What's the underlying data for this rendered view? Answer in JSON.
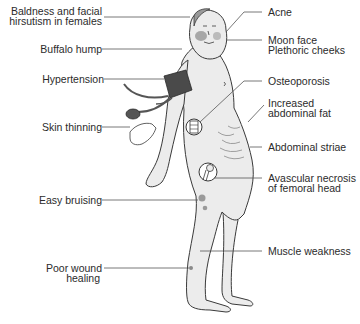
{
  "diagram": {
    "colors": {
      "skin": "#ececec",
      "outline": "#3a3a3a",
      "leader_line": "#555555",
      "cuff": "#4a4a4a",
      "cheek": "#8a8a8a",
      "bruise": "#9a9a9a",
      "text": "#2b2b2b"
    }
  },
  "labels_left": [
    {
      "id": "baldness",
      "lines": [
        "Baldness and facial",
        "hirsutism in females"
      ]
    },
    {
      "id": "buffalo-hump",
      "lines": [
        "Buffalo hump"
      ]
    },
    {
      "id": "hypertension",
      "lines": [
        "Hypertension"
      ]
    },
    {
      "id": "skin-thinning",
      "lines": [
        "Skin thinning"
      ]
    },
    {
      "id": "easy-bruising",
      "lines": [
        "Easy bruising"
      ]
    },
    {
      "id": "poor-wound-healing",
      "lines": [
        "Poor wound",
        "healing"
      ]
    }
  ],
  "labels_right": [
    {
      "id": "acne",
      "lines": [
        "Acne"
      ]
    },
    {
      "id": "moon-face",
      "lines": [
        "Moon face",
        "Plethoric cheeks"
      ]
    },
    {
      "id": "osteoporosis",
      "lines": [
        "Osteoporosis"
      ]
    },
    {
      "id": "abdominal-fat",
      "lines": [
        "Increased",
        "abdominal fat"
      ]
    },
    {
      "id": "abdominal-striae",
      "lines": [
        "Abdominal striae"
      ]
    },
    {
      "id": "avascular-necrosis",
      "lines": [
        "Avascular necrosis",
        "of femoral head"
      ]
    },
    {
      "id": "muscle-weakness",
      "lines": [
        "Muscle weakness"
      ]
    }
  ]
}
